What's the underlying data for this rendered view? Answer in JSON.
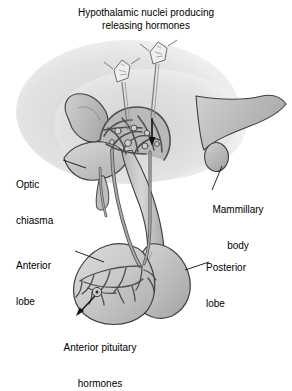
{
  "figure": {
    "title_line1": "Hypothalamic nuclei producing",
    "title_line2": "releasing hormones",
    "type": "anatomical-diagram",
    "palette": {
      "background": "#ffffff",
      "outline": "#3a3a3a",
      "tissue_light": "#dcdcdc",
      "tissue_mid": "#c4c4c4",
      "tissue_dark": "#ababab",
      "vessel": "#9a9a9a",
      "vessel_outline": "#4a4a4a",
      "text": "#000000",
      "leader": "#1a1a1a"
    }
  },
  "labels": {
    "optic_chiasma": {
      "line1": "Optic",
      "line2": "chiasma"
    },
    "mammillary_body": {
      "line1": "Mammillary",
      "line2": "body"
    },
    "anterior_lobe": {
      "line1": "Anterior",
      "line2": "lobe"
    },
    "posterior_lobe": {
      "line1": "Posterior",
      "line2": "lobe"
    },
    "anterior_pituitary_hormones": {
      "line1": "Anterior pituitary",
      "line2": "hormones"
    }
  },
  "structures": [
    {
      "name": "hypothalamus",
      "label": ""
    },
    {
      "name": "neurosecretory-cell-1",
      "label": ""
    },
    {
      "name": "neurosecretory-cell-2",
      "label": ""
    },
    {
      "name": "primary-capillary-plexus",
      "label": ""
    },
    {
      "name": "hypophyseal-portal-veins",
      "label": ""
    },
    {
      "name": "secondary-capillary-plexus",
      "label": ""
    },
    {
      "name": "optic-chiasma",
      "label": "Optic chiasma"
    },
    {
      "name": "mammillary-body",
      "label": "Mammillary body"
    },
    {
      "name": "infundibulum",
      "label": ""
    },
    {
      "name": "anterior-lobe",
      "label": "Anterior lobe"
    },
    {
      "name": "posterior-lobe",
      "label": "Posterior lobe"
    },
    {
      "name": "hormone-release-site",
      "label": ""
    }
  ]
}
